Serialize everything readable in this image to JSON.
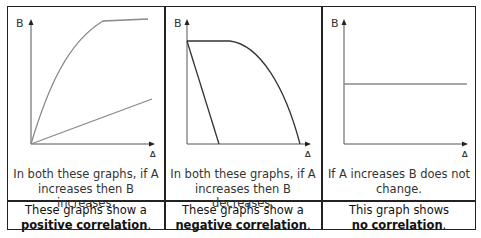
{
  "columns": [
    {
      "axis_x_label": "A",
      "axis_y_label": "B",
      "description": "In both these graphs, if A increases then B increases.",
      "description_lines": [
        "In both these graphs, if A",
        "increases then B increases."
      ],
      "conclusion_line1": "These graphs show a",
      "conclusion_bold1": "positive",
      "conclusion_bold2": "correlation",
      "conclusion_tail": "."
    },
    {
      "axis_x_label": "A",
      "axis_y_label": "B",
      "description": "In both these graphs, if A increases then B decreases.",
      "description_lines": [
        "In both these graphs, if A",
        "increases then B decreases."
      ],
      "conclusion_line1": "These graphs show a",
      "conclusion_bold1": "negative",
      "conclusion_bold2": "correlation",
      "conclusion_tail": "."
    },
    {
      "axis_x_label": "A",
      "axis_y_label": "B",
      "description": "If A increases B does not change.",
      "description_lines": [
        "If A increases B does not",
        "change."
      ],
      "conclusion_line1": "This graph shows",
      "conclusion_bold1": "no",
      "conclusion_bold2": "correlation",
      "conclusion_tail": "."
    }
  ],
  "colors": {
    "border": "#222222",
    "axis": "#555555",
    "positive_curves": "#888888",
    "negative_curves": "#333333",
    "no_corr_line": "#888888"
  }
}
